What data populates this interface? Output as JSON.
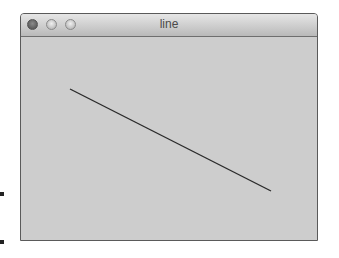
{
  "window": {
    "title": "line",
    "buttons": [
      "close",
      "minimize",
      "zoom"
    ]
  },
  "canvas": {
    "line": {
      "x1": 49,
      "y1": 52,
      "x2": 250,
      "y2": 154,
      "color": "#2a2a2a",
      "width": 1.4
    }
  }
}
